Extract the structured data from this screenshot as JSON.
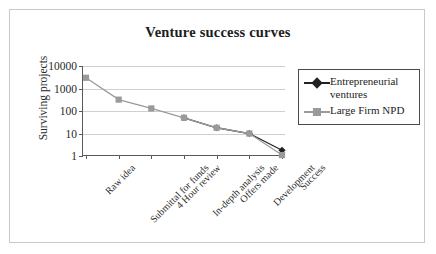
{
  "chart_data": {
    "type": "line",
    "title": "Venture success curves",
    "xlabel": "",
    "ylabel": "Surviving projects",
    "yscale": "log",
    "ylim": [
      1,
      10000
    ],
    "ytick_labels": [
      "10000",
      "1000",
      "100",
      "10",
      "1"
    ],
    "ytick_values": [
      10000,
      1000,
      100,
      10,
      1
    ],
    "grid": true,
    "legend_position": "right",
    "categories": [
      "Raw idea",
      "Submittal for funds",
      "4 Hour review",
      "In-depth analysis",
      "Offers made",
      "Development",
      "Success"
    ],
    "series": [
      {
        "name": "Entrepreneurial ventures",
        "color": "#222222",
        "marker": "diamond",
        "values": [
          null,
          null,
          null,
          50,
          18,
          10,
          1.8
        ]
      },
      {
        "name": "Large Firm NPD",
        "color": "#9a9a9a",
        "marker": "square",
        "values": [
          3000,
          320,
          130,
          50,
          18,
          10,
          1.1
        ]
      }
    ]
  },
  "legend": {
    "items": [
      {
        "label": "Entrepreneurial ventures",
        "color": "#222222",
        "marker": "diamond"
      },
      {
        "label": "Large Firm NPD",
        "color": "#9a9a9a",
        "marker": "square"
      }
    ]
  },
  "colors": {
    "frame_border": "#c9c9c9",
    "axis": "#5a5a5a",
    "gridline": "#d0d0d0",
    "legend_border": "#4a4a4a",
    "text": "#1d1d1d",
    "background": "#ffffff"
  }
}
